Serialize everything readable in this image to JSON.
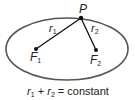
{
  "diagram": {
    "point_label": "P",
    "focus1_label": "F",
    "focus1_sub": "1",
    "focus2_label": "F",
    "focus2_sub": "2",
    "r1_label": "r",
    "r1_sub": "1",
    "r2_label": "r",
    "r2_sub": "2",
    "equation": {
      "r1": "r",
      "r1_sub": "1",
      "plus": " + ",
      "r2": "r",
      "r2_sub": "2",
      "rest": " = constant"
    },
    "colors": {
      "ellipse_stroke": "#555555",
      "line": "#111111",
      "text": "#222222"
    }
  }
}
